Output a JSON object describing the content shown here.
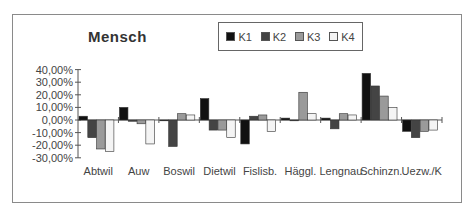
{
  "chart_data": {
    "type": "bar",
    "title": "Mensch",
    "xlabel": "",
    "ylabel": "",
    "ylim": [
      -0.3,
      0.4
    ],
    "yticks": [
      "40,00%",
      "30,00%",
      "20,00%",
      "10,00%",
      "0,00%",
      "-10,00%",
      "-20,00%",
      "-30,00%"
    ],
    "grid": false,
    "legend_position": "top-right",
    "categories": [
      "Abtwil",
      "Auw",
      "Boswil",
      "Dietwil",
      "Fislisb.",
      "Häggl.",
      "Lengnau",
      "Schinzn.",
      "Uezw./K"
    ],
    "series": [
      {
        "name": "K1",
        "color": "#111111",
        "values": [
          3,
          10,
          0,
          17,
          -19,
          1.5,
          1.5,
          37,
          -9
        ]
      },
      {
        "name": "K2",
        "color": "#444444",
        "values": [
          -14,
          -1,
          -21,
          -8,
          3,
          0,
          -7,
          27,
          -14
        ]
      },
      {
        "name": "K3",
        "color": "#9a9a9a",
        "values": [
          -23,
          -3,
          5,
          -8,
          4,
          22,
          5,
          19,
          -9
        ]
      },
      {
        "name": "K4",
        "color": "#f4f4f4",
        "values": [
          -25,
          -19,
          4,
          -14,
          -9,
          5,
          4,
          10,
          -8
        ]
      }
    ]
  },
  "legend": {
    "items": [
      "K1",
      "K2",
      "K3",
      "K4"
    ]
  }
}
